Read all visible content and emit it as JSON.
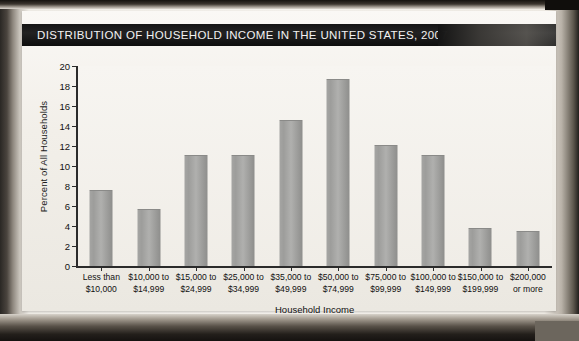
{
  "banner": {
    "title": "DISTRIBUTION OF HOUSEHOLD INCOME IN THE UNITED STATES, 2007"
  },
  "colors": {
    "bar_fill": "#a0a09e",
    "banner_bg": "#151515",
    "banner_text": "#f2f2f2",
    "axis": "#2b2b2b",
    "plot_bg": "#f4f1ec"
  },
  "chart_data": {
    "type": "bar",
    "title": "DISTRIBUTION OF HOUSEHOLD INCOME IN THE UNITED STATES, 2007",
    "xlabel": "Household Income",
    "ylabel": "Percent of All Households",
    "categories": [
      "Less than $10,000",
      "$10,000 to $14,999",
      "$15,000 to $24,999",
      "$25,000 to $34,999",
      "$35,000 to $49,999",
      "$50,000 to $74,999",
      "$75,000 to $99,999",
      "$100,000 to $149,999",
      "$150,000 to $199,999",
      "$200,000 or more"
    ],
    "category_lines": [
      [
        "Less than",
        "$10,000"
      ],
      [
        "$10,000 to",
        "$14,999"
      ],
      [
        "$15,000 to",
        "$24,999"
      ],
      [
        "$25,000 to",
        "$34,999"
      ],
      [
        "$35,000 to",
        "$49,999"
      ],
      [
        "$50,000 to",
        "$74,999"
      ],
      [
        "$75,000 to",
        "$99,999"
      ],
      [
        "$100,000 to",
        "$149,999"
      ],
      [
        "$150,000 to",
        "$199,999"
      ],
      [
        "$200,000",
        "or more"
      ]
    ],
    "values": [
      7.5,
      5.6,
      11.0,
      11.0,
      14.5,
      18.6,
      12.0,
      11.0,
      3.7,
      3.4
    ],
    "ylim": [
      0,
      20
    ],
    "yticks": [
      0,
      2,
      4,
      6,
      8,
      10,
      12,
      14,
      16,
      18,
      20
    ],
    "ytick_labels": [
      "0",
      "2",
      "4",
      "6",
      "8",
      "10",
      "12",
      "14",
      "16",
      "18",
      "20"
    ],
    "grid": false,
    "legend": null
  }
}
